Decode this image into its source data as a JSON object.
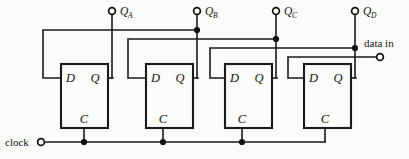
{
  "figure": {
    "background_color": "#fbfbf9",
    "line_color": "#1a1a1a",
    "width": 409,
    "height": 159
  },
  "inputs": {
    "clock": {
      "label": "clock",
      "terminal_x": 41,
      "terminal_y": 142
    },
    "data_in": {
      "label": "data in",
      "terminal_x": 381,
      "terminal_y": 57
    }
  },
  "outputs": [
    {
      "name": "QA",
      "base": "Q",
      "subscript": "A",
      "terminal_x": 112,
      "terminal_y": 11
    },
    {
      "name": "QB",
      "base": "Q",
      "subscript": "B",
      "terminal_x": 197,
      "terminal_y": 11
    },
    {
      "name": "QC",
      "base": "Q",
      "subscript": "C",
      "terminal_x": 276,
      "terminal_y": 11
    },
    {
      "name": "QD",
      "base": "Q",
      "subscript": "D",
      "terminal_x": 355,
      "terminal_y": 11
    }
  ],
  "flipflops": [
    {
      "id": "ff-a",
      "x": 61,
      "y": 64,
      "w": 47,
      "h": 64,
      "d_label": "D",
      "q_label": "Q",
      "c_label": "C"
    },
    {
      "id": "ff-b",
      "x": 146,
      "y": 64,
      "w": 47,
      "h": 64,
      "d_label": "D",
      "q_label": "Q",
      "c_label": "C"
    },
    {
      "id": "ff-c",
      "x": 225,
      "y": 64,
      "w": 47,
      "h": 64,
      "d_label": "D",
      "q_label": "Q",
      "c_label": "C"
    },
    {
      "id": "ff-d",
      "x": 304,
      "y": 64,
      "w": 47,
      "h": 64,
      "d_label": "D",
      "q_label": "Q",
      "c_label": "C"
    }
  ],
  "feedback_levels": [
    30,
    39,
    48,
    57
  ],
  "clock_bus_y": 142
}
